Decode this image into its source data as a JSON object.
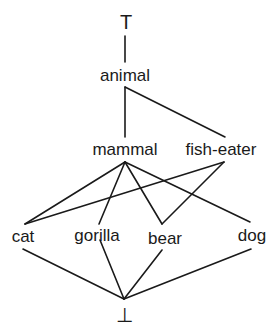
{
  "diagram": {
    "type": "lattice",
    "nodes": [
      {
        "id": "top",
        "label": "T"
      },
      {
        "id": "animal",
        "label": "animal"
      },
      {
        "id": "mammal",
        "label": "mammal"
      },
      {
        "id": "fish_eater",
        "label": "fish-eater"
      },
      {
        "id": "cat",
        "label": "cat"
      },
      {
        "id": "gorilla",
        "label": "gorilla"
      },
      {
        "id": "bear",
        "label": "bear"
      },
      {
        "id": "dog",
        "label": "dog"
      },
      {
        "id": "bottom",
        "label": "⊥"
      }
    ],
    "edges": [
      [
        "top",
        "animal"
      ],
      [
        "animal",
        "mammal"
      ],
      [
        "animal",
        "fish_eater"
      ],
      [
        "mammal",
        "cat"
      ],
      [
        "mammal",
        "gorilla"
      ],
      [
        "mammal",
        "bear"
      ],
      [
        "mammal",
        "dog"
      ],
      [
        "fish_eater",
        "cat"
      ],
      [
        "fish_eater",
        "bear"
      ],
      [
        "cat",
        "bottom"
      ],
      [
        "gorilla",
        "bottom"
      ],
      [
        "bear",
        "bottom"
      ],
      [
        "dog",
        "bottom"
      ]
    ],
    "line_color": "#1a1a1a"
  }
}
